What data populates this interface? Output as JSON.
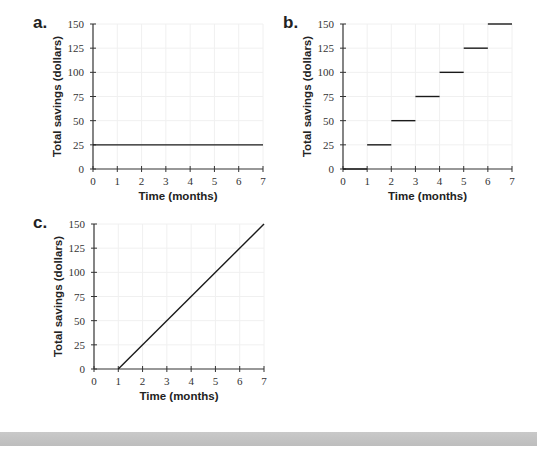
{
  "chart_data": [
    {
      "id": "a",
      "panel_label": "a.",
      "type": "line",
      "title": "",
      "xlabel": "Time (months)",
      "ylabel": "Total savings (dollars)",
      "xlim": [
        0,
        7
      ],
      "ylim": [
        0,
        150
      ],
      "x_ticks": [
        0,
        1,
        2,
        3,
        4,
        5,
        6,
        7
      ],
      "y_ticks": [
        0,
        25,
        50,
        75,
        100,
        125,
        150
      ],
      "grid": true,
      "series": [
        {
          "name": "savings",
          "segments": [
            {
              "x": [
                0,
                7
              ],
              "y": [
                25,
                25
              ]
            }
          ]
        }
      ],
      "layout": {
        "ox": 93,
        "oy": 169,
        "x_end": 263,
        "y_top": 24
      }
    },
    {
      "id": "b",
      "panel_label": "b.",
      "type": "line",
      "title": "",
      "xlabel": "Time (months)",
      "ylabel": "Total savings (dollars)",
      "xlim": [
        0,
        7
      ],
      "ylim": [
        0,
        150
      ],
      "x_ticks": [
        0,
        1,
        2,
        3,
        4,
        5,
        6,
        7
      ],
      "y_ticks": [
        0,
        25,
        50,
        75,
        100,
        125,
        150
      ],
      "grid": true,
      "series": [
        {
          "name": "savings",
          "segments": [
            {
              "x": [
                0,
                1
              ],
              "y": [
                0,
                0
              ]
            },
            {
              "x": [
                1,
                2
              ],
              "y": [
                25,
                25
              ]
            },
            {
              "x": [
                2,
                3
              ],
              "y": [
                50,
                50
              ]
            },
            {
              "x": [
                3,
                4
              ],
              "y": [
                75,
                75
              ]
            },
            {
              "x": [
                4,
                5
              ],
              "y": [
                100,
                100
              ]
            },
            {
              "x": [
                5,
                6
              ],
              "y": [
                125,
                125
              ]
            },
            {
              "x": [
                6,
                7
              ],
              "y": [
                150,
                150
              ]
            }
          ]
        }
      ],
      "layout": {
        "ox": 343,
        "oy": 169,
        "x_end": 512,
        "y_top": 24
      }
    },
    {
      "id": "c",
      "panel_label": "c.",
      "type": "line",
      "title": "",
      "xlabel": "Time (months)",
      "ylabel": "Total savings (dollars)",
      "xlim": [
        0,
        7
      ],
      "ylim": [
        0,
        150
      ],
      "x_ticks": [
        0,
        1,
        2,
        3,
        4,
        5,
        6,
        7
      ],
      "y_ticks": [
        0,
        25,
        50,
        75,
        100,
        125,
        150
      ],
      "grid": true,
      "series": [
        {
          "name": "savings",
          "segments": [
            {
              "x": [
                1,
                7
              ],
              "y": [
                0,
                150
              ]
            }
          ]
        }
      ],
      "layout": {
        "ox": 94,
        "oy": 369,
        "x_end": 264,
        "y_top": 224
      }
    }
  ],
  "colors": {
    "line": "#1a1a1a",
    "axis": "#333333",
    "grid": "#f0f0f0",
    "bottom_bar": "#c4c4c4"
  }
}
